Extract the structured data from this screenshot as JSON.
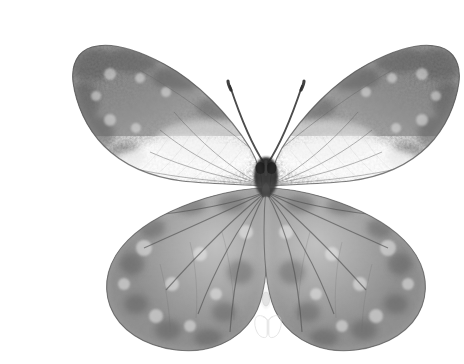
{
  "image": {
    "kind": "natural-image",
    "subject": "butterfly-specimen-dorsal-view",
    "title": "Grayscale butterfly specimen, wings spread, dorsal view",
    "alt_text": "Black and white photograph of a pinned butterfly specimen with both wings spread symmetrically against a plain white background",
    "width_px": 452,
    "height_px": 364,
    "background_color": "#ffffff",
    "orientation": "landscape",
    "color_mode": "grayscale"
  },
  "palette": {
    "background": "#ffffff",
    "wing_dark": "#5c5c5c",
    "wing_mid": "#8f8f8f",
    "wing_light": "#d8d8d8",
    "wing_pale_band": "#f4f4f4",
    "wing_edge_outline": "#4a4a4a",
    "vein": "#555555",
    "body_dark": "#1a1a1a",
    "thorax": "#2b2b2b",
    "abdomen_pale": "#ededed",
    "antenna": "#3a3a3a",
    "watermark": "#dddddd"
  },
  "anatomy": {
    "parts": [
      {
        "id": "left-forewing",
        "label": "Left forewing",
        "side": "left",
        "bbox": [
          30,
          28,
          222,
          176
        ],
        "description": "Triangular upper wing, dark mottled scaling along the costal and apical margins fading to a broad pale cream band across the lower inner half"
      },
      {
        "id": "right-forewing",
        "label": "Right forewing",
        "side": "right",
        "bbox": [
          230,
          28,
          422,
          176
        ],
        "description": "Mirror image of the left forewing, dark apex with pale discal band"
      },
      {
        "id": "left-hindwing",
        "label": "Left hindwing",
        "side": "left",
        "bbox": [
          62,
          158,
          232,
          336
        ],
        "description": "Rounded lower wing, uniformly mottled mid-grey with darker submarginal spot row and visible radiating veins"
      },
      {
        "id": "right-hindwing",
        "label": "Right hindwing",
        "side": "right",
        "bbox": [
          220,
          158,
          390,
          336
        ],
        "description": "Mirror image of the left hindwing"
      },
      {
        "id": "thorax",
        "label": "Thorax and head",
        "side": "center",
        "bbox": [
          214,
          138,
          240,
          172
        ],
        "description": "Compact near-black head and thorax with two large dark compound eyes"
      },
      {
        "id": "abdomen",
        "label": "Abdomen",
        "side": "center",
        "bbox": [
          218,
          170,
          238,
          290
        ],
        "description": "Slender pale tapering abdomen overlaid by the inner wing margins"
      },
      {
        "id": "left-antenna",
        "label": "Left antenna",
        "side": "left",
        "bbox": [
          186,
          66,
          226,
          146
        ],
        "description": "Thin dark antenna angled up and to the left with a slightly thickened club at the tip"
      },
      {
        "id": "right-antenna",
        "label": "Right antenna",
        "side": "right",
        "bbox": [
          228,
          66,
          268,
          146
        ],
        "description": "Thin dark antenna angled up and to the right with a clubbed tip"
      }
    ],
    "symmetry_axis_x": 226,
    "wingspan_px": 392
  },
  "watermark": {
    "present": true,
    "label": "butterfly-outline-watermark",
    "shape": "butterfly",
    "center": [
      228,
      312
    ],
    "size_px": 26,
    "stroke_color": "#d9d9d9",
    "opacity": 0.75
  },
  "texture": {
    "type": "mottled-scale-speckle",
    "noise_frequency": 0.42,
    "noise_octaves": 4,
    "description": "Fine granular speckling typical of lepidopteran wing scales captured at high magnification"
  }
}
